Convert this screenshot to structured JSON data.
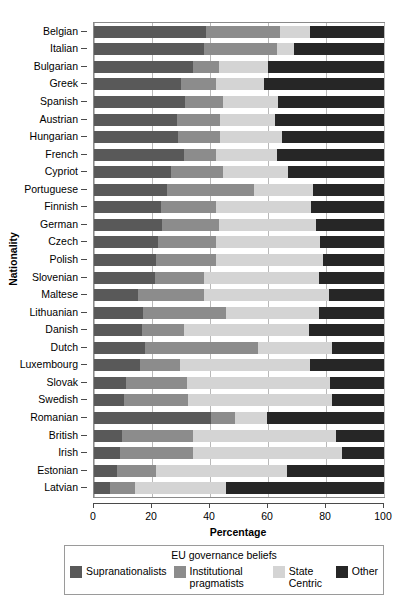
{
  "chart_data": {
    "type": "bar",
    "orientation": "horizontal",
    "stacked": true,
    "stack_mode": "percent",
    "title": "",
    "xlabel": "Percentage",
    "ylabel": "Nationality",
    "xlim": [
      0,
      100
    ],
    "xticks": [
      0,
      20,
      40,
      60,
      80,
      100
    ],
    "grid": "vertical",
    "legend_title": "EU governance beliefs",
    "legend_position": "bottom",
    "series": [
      {
        "name": "Supranationalists",
        "color": "#595959",
        "values": [
          38.5,
          38.0,
          34.0,
          30.0,
          31.5,
          28.5,
          29.0,
          31.0,
          26.5,
          25.0,
          23.0,
          23.5,
          22.0,
          21.5,
          21.0,
          15.0,
          17.0,
          16.5,
          17.5,
          16.0,
          11.0,
          10.5,
          40.5,
          9.5,
          9.0,
          8.0,
          5.5
        ]
      },
      {
        "name": "Institutional pragmatists",
        "color": "#8c8c8c",
        "values": [
          25.5,
          25.0,
          9.0,
          12.0,
          13.0,
          15.0,
          14.5,
          11.0,
          18.0,
          30.0,
          19.0,
          19.5,
          20.0,
          20.5,
          17.0,
          23.0,
          28.5,
          14.5,
          39.0,
          13.5,
          21.0,
          22.0,
          8.0,
          24.5,
          25.0,
          13.5,
          8.5
        ]
      },
      {
        "name": "State Centric",
        "color": "#d4d4d4",
        "values": [
          10.5,
          6.0,
          17.0,
          16.5,
          19.0,
          19.0,
          21.5,
          21.0,
          22.5,
          20.5,
          33.0,
          33.5,
          36.0,
          37.0,
          39.5,
          43.0,
          32.0,
          43.0,
          25.5,
          45.0,
          49.5,
          49.5,
          11.0,
          49.5,
          51.5,
          45.0,
          31.5
        ]
      },
      {
        "name": "Other",
        "color": "#262626",
        "values": [
          25.5,
          31.0,
          40.0,
          41.5,
          36.5,
          37.5,
          35.0,
          37.0,
          33.0,
          24.5,
          25.0,
          23.5,
          22.0,
          21.0,
          22.5,
          19.0,
          22.5,
          26.0,
          18.0,
          25.5,
          18.5,
          18.0,
          40.5,
          16.5,
          14.5,
          33.5,
          54.5
        ]
      }
    ],
    "categories": [
      "Belgian",
      "Italian",
      "Bulgarian",
      "Greek",
      "Spanish",
      "Austrian",
      "Hungarian",
      "French",
      "Cypriot",
      "Portuguese",
      "Finnish",
      "German",
      "Czech",
      "Polish",
      "Slovenian",
      "Maltese",
      "Lithuanian",
      "Danish",
      "Dutch",
      "Luxembourg",
      "Slovak",
      "Swedish",
      "Romanian",
      "British",
      "Irish",
      "Estonian",
      "Latvian"
    ]
  },
  "axes": {
    "x_title": "Percentage",
    "y_title": "Nationality",
    "x_tick_labels": [
      "0",
      "20",
      "40",
      "60",
      "80",
      "100"
    ]
  },
  "legend": {
    "title": "EU governance beliefs",
    "entries": [
      {
        "label": "Supranationalists",
        "color": "#595959"
      },
      {
        "label": "Institutional pragmatists",
        "color": "#8c8c8c"
      },
      {
        "label": "State Centric",
        "color": "#d4d4d4"
      },
      {
        "label": "Other",
        "color": "#262626"
      }
    ]
  }
}
